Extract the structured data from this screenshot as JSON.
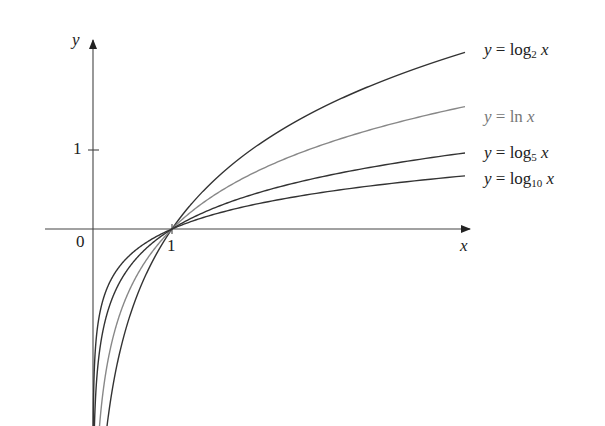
{
  "chart_data": {
    "type": "line",
    "title": "",
    "xlabel": "x",
    "ylabel": "y",
    "origin_label": "0",
    "x_ticks": [
      {
        "value": 1,
        "label": "1"
      }
    ],
    "y_ticks": [
      {
        "value": 1,
        "label": "1"
      }
    ],
    "xlim": [
      -0.6,
      4.8
    ],
    "ylim": [
      -2.5,
      2.4
    ],
    "grid": false,
    "legend_position": "inline-right",
    "series": [
      {
        "name": "y = log2 x",
        "base": 2,
        "label_prefix": "y = log",
        "label_sub": "2",
        "label_suffix": " x",
        "color": "#333333"
      },
      {
        "name": "y = ln x",
        "base": 2.718281828,
        "label_prefix": "y = ln x",
        "label_sub": "",
        "label_suffix": "",
        "color": "#888888"
      },
      {
        "name": "y = log5 x",
        "base": 5,
        "label_prefix": "y = log",
        "label_sub": "5",
        "label_suffix": " x",
        "color": "#333333"
      },
      {
        "name": "y = log10 x",
        "base": 10,
        "label_prefix": "y = log",
        "label_sub": "10",
        "label_suffix": " x",
        "color": "#333333"
      }
    ],
    "annotations": [
      "All curves pass through (1, 0)"
    ]
  }
}
